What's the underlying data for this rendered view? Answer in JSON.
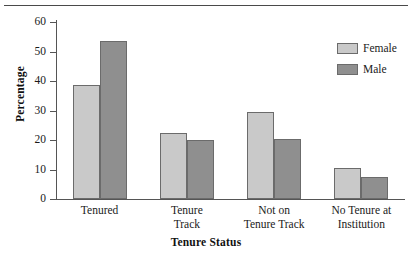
{
  "chart_data": {
    "type": "bar",
    "title": "",
    "xlabel": "Tenure Status",
    "ylabel": "Percentage",
    "categories": [
      "Tenured",
      "Tenure Track",
      "Not on Tenure Track",
      "No Tenure at Institution"
    ],
    "category_lines": [
      [
        "Tenured"
      ],
      [
        "Tenure",
        "Track"
      ],
      [
        "Not on",
        "Tenure Track"
      ],
      [
        "No Tenure at",
        "Institution"
      ]
    ],
    "series": [
      {
        "name": "Female",
        "color": "#c9c9c9",
        "values": [
          38.5,
          22.5,
          29.5,
          10.5
        ]
      },
      {
        "name": "Male",
        "color": "#8f8f8f",
        "values": [
          53.5,
          20.0,
          20.5,
          7.5
        ]
      }
    ],
    "ylim": [
      0,
      60
    ],
    "yticks": [
      0,
      10,
      20,
      30,
      40,
      50,
      60
    ],
    "ytick_labels": [
      "0",
      "10",
      "20",
      "30",
      "40",
      "50",
      "60"
    ],
    "grid": false,
    "legend_position": "upper right"
  },
  "legend": {
    "entries": [
      {
        "label": "Female",
        "swatch": "female"
      },
      {
        "label": "Male",
        "swatch": "male"
      }
    ]
  },
  "colors": {
    "female": "#c9c9c9",
    "male": "#8f8f8f",
    "outline": "#6b6b6b",
    "axis": "#555555",
    "text": "#1a1a1a"
  }
}
